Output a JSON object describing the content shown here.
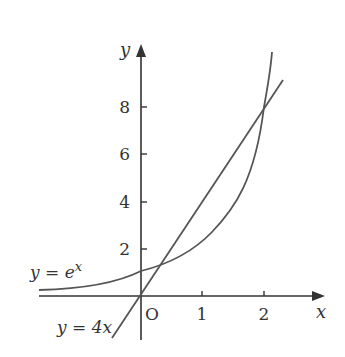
{
  "diagram": {
    "axes": {
      "x_label": "x",
      "y_label": "y",
      "origin_label": "O",
      "x_ticks": [
        "1",
        "2"
      ],
      "y_ticks": [
        "2",
        "4",
        "6",
        "8"
      ]
    },
    "curves": [
      {
        "name": "exponential",
        "label": "y = e",
        "superscript": "x"
      },
      {
        "name": "line",
        "label": "y = 4x"
      }
    ],
    "colors": {
      "stroke": "#555555",
      "text": "#333333"
    }
  }
}
